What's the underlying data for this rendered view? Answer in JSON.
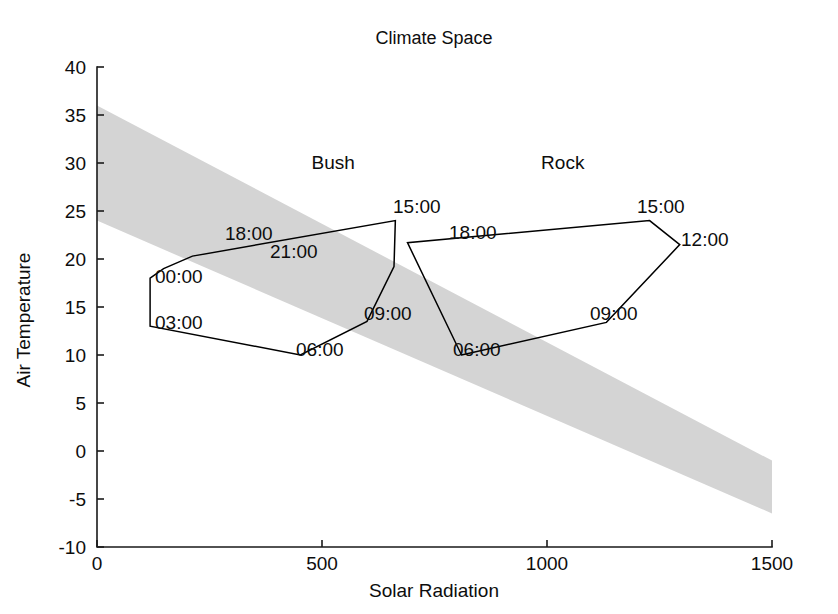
{
  "chart_data": {
    "type": "line",
    "title": "Climate Space",
    "xlabel": "Solar Radiation",
    "ylabel": "Air Temperature",
    "xlim": [
      0,
      1500
    ],
    "ylim": [
      -10,
      40
    ],
    "xticks": [
      0,
      500,
      1000,
      1500
    ],
    "xtick_labels": [
      "0",
      "500",
      "1000",
      "1500"
    ],
    "yticks": [
      -10,
      -5,
      0,
      5,
      10,
      15,
      20,
      25,
      30,
      35,
      40
    ],
    "ytick_labels": [
      "-10",
      "-5",
      "0",
      "5",
      "10",
      "15",
      "20",
      "25",
      "30",
      "35",
      "40"
    ],
    "grid": false,
    "legend": "none",
    "annotations": [
      {
        "text": "Bush",
        "x": 525,
        "y": 30
      },
      {
        "text": "Rock",
        "x": 1035,
        "y": 30
      }
    ],
    "bands": [
      {
        "name": "thermoneutral-zone",
        "color": "#d4d4d4",
        "upper": [
          [
            0,
            36.0
          ],
          [
            1500,
            -1.0
          ]
        ],
        "lower": [
          [
            0,
            24.0
          ],
          [
            1500,
            -6.5
          ]
        ]
      }
    ],
    "series": [
      {
        "name": "Bush",
        "closed": true,
        "points": [
          {
            "label": "00:00",
            "x": 118,
            "y": 18.0
          },
          {
            "label": "03:00",
            "x": 118,
            "y": 13.0
          },
          {
            "label": "06:00",
            "x": 452,
            "y": 10.0
          },
          {
            "label": "09:00",
            "x": 600,
            "y": 13.5
          },
          {
            "label": "12:00",
            "x": 660,
            "y": 19.2
          },
          {
            "label": "15:00",
            "x": 663,
            "y": 24.0
          },
          {
            "label": "18:00",
            "x": 212,
            "y": 20.3
          },
          {
            "label": "21:00",
            "x": 148,
            "y": 19.0
          }
        ]
      },
      {
        "name": "Rock",
        "closed": true,
        "points": [
          {
            "label": "06:00",
            "x": 810,
            "y": 10.0
          },
          {
            "label": "09:00",
            "x": 1132,
            "y": 13.4
          },
          {
            "label": "12:00",
            "x": 1295,
            "y": 21.5
          },
          {
            "label": "15:00",
            "x": 1228,
            "y": 24.0
          },
          {
            "label": "18:00",
            "x": 690,
            "y": 21.7
          }
        ]
      }
    ],
    "point_labels": [
      {
        "text": "15:00",
        "px": 393,
        "py": 213
      },
      {
        "text": "18:00",
        "px": 225,
        "py": 240
      },
      {
        "text": "21:00",
        "px": 270,
        "py": 258
      },
      {
        "text": "00:00",
        "px": 155,
        "py": 283
      },
      {
        "text": "03:00",
        "px": 155,
        "py": 329
      },
      {
        "text": "06:00",
        "px": 296,
        "py": 356
      },
      {
        "text": "09:00",
        "px": 364,
        "py": 320
      },
      {
        "text": "18:00",
        "px": 449,
        "py": 239
      },
      {
        "text": "15:00",
        "px": 637,
        "py": 213
      },
      {
        "text": "12:00",
        "px": 681,
        "py": 246
      },
      {
        "text": "09:00",
        "px": 590,
        "py": 320
      },
      {
        "text": "06:00",
        "px": 453,
        "py": 356
      }
    ]
  },
  "geometry": {
    "plot_left": 97,
    "plot_right": 772,
    "plot_top": 67,
    "plot_bottom": 547,
    "title_px": 434,
    "title_py": 44,
    "xlabel_px": 434,
    "xlabel_py": 597,
    "ylabel_px": 30,
    "ylabel_py": 320
  }
}
